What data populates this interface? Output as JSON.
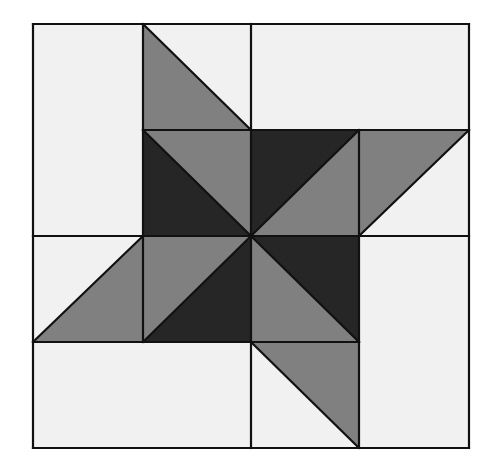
{
  "diagram": {
    "colors": {
      "light": "#f1f1f1",
      "medium": "#808080",
      "dark": "#262626",
      "stroke": "#111111",
      "background": "#ffffff"
    },
    "grid": {
      "xs": [
        33,
        143,
        251,
        359,
        469
      ],
      "ys": [
        24,
        130,
        236,
        342,
        448
      ]
    },
    "shapes": [
      {
        "name": "light-rect-left-top",
        "fill": "light",
        "points": [
          [
            33,
            24
          ],
          [
            143,
            24
          ],
          [
            143,
            236
          ],
          [
            33,
            236
          ]
        ]
      },
      {
        "name": "light-rect-top-right",
        "fill": "light",
        "points": [
          [
            251,
            24
          ],
          [
            469,
            24
          ],
          [
            469,
            130
          ],
          [
            251,
            130
          ]
        ]
      },
      {
        "name": "light-tri-top-mid",
        "fill": "light",
        "points": [
          [
            143,
            24
          ],
          [
            251,
            24
          ],
          [
            251,
            130
          ]
        ]
      },
      {
        "name": "medium-tri-top-mid",
        "fill": "medium",
        "points": [
          [
            143,
            24
          ],
          [
            251,
            130
          ],
          [
            143,
            130
          ]
        ]
      },
      {
        "name": "light-rect-top-col2",
        "fill": "light",
        "points": [
          [
            251,
            24
          ],
          [
            251,
            130
          ]
        ]
      },
      {
        "name": "dark-tri-r1c1",
        "fill": "dark",
        "points": [
          [
            143,
            130
          ],
          [
            251,
            236
          ],
          [
            143,
            236
          ]
        ]
      },
      {
        "name": "medium-tri-r1c1",
        "fill": "medium",
        "points": [
          [
            143,
            130
          ],
          [
            251,
            130
          ],
          [
            251,
            236
          ]
        ]
      },
      {
        "name": "dark-tri-r1c2",
        "fill": "dark",
        "points": [
          [
            251,
            130
          ],
          [
            359,
            130
          ],
          [
            251,
            236
          ]
        ]
      },
      {
        "name": "medium-tri-r1c2",
        "fill": "medium",
        "points": [
          [
            359,
            130
          ],
          [
            359,
            236
          ],
          [
            251,
            236
          ]
        ]
      },
      {
        "name": "medium-tri-r1c3",
        "fill": "medium",
        "points": [
          [
            359,
            130
          ],
          [
            469,
            130
          ],
          [
            359,
            236
          ]
        ]
      },
      {
        "name": "light-tri-r1c3",
        "fill": "light",
        "points": [
          [
            469,
            130
          ],
          [
            469,
            236
          ],
          [
            359,
            236
          ]
        ]
      },
      {
        "name": "light-tri-r2c0",
        "fill": "light",
        "points": [
          [
            33,
            236
          ],
          [
            143,
            236
          ],
          [
            33,
            342
          ]
        ]
      },
      {
        "name": "medium-tri-r2c0",
        "fill": "medium",
        "points": [
          [
            143,
            236
          ],
          [
            143,
            342
          ],
          [
            33,
            342
          ]
        ]
      },
      {
        "name": "medium-tri-r2c1",
        "fill": "medium",
        "points": [
          [
            143,
            236
          ],
          [
            251,
            236
          ],
          [
            143,
            342
          ]
        ]
      },
      {
        "name": "dark-tri-r2c1",
        "fill": "dark",
        "points": [
          [
            251,
            236
          ],
          [
            251,
            342
          ],
          [
            143,
            342
          ]
        ]
      },
      {
        "name": "dark-tri-r2c2",
        "fill": "dark",
        "points": [
          [
            251,
            236
          ],
          [
            359,
            236
          ],
          [
            359,
            342
          ]
        ]
      },
      {
        "name": "medium-tri-r2c2",
        "fill": "medium",
        "points": [
          [
            251,
            236
          ],
          [
            359,
            342
          ],
          [
            251,
            342
          ]
        ]
      },
      {
        "name": "light-rect-right-bottom",
        "fill": "light",
        "points": [
          [
            359,
            236
          ],
          [
            469,
            236
          ],
          [
            469,
            448
          ],
          [
            359,
            448
          ]
        ]
      },
      {
        "name": "light-rect-bottom-left",
        "fill": "light",
        "points": [
          [
            33,
            342
          ],
          [
            251,
            342
          ],
          [
            251,
            448
          ],
          [
            33,
            448
          ]
        ]
      },
      {
        "name": "medium-tri-r3c2",
        "fill": "medium",
        "points": [
          [
            251,
            342
          ],
          [
            359,
            342
          ],
          [
            359,
            448
          ]
        ]
      },
      {
        "name": "light-tri-r3c2",
        "fill": "light",
        "points": [
          [
            251,
            342
          ],
          [
            359,
            448
          ],
          [
            251,
            448
          ]
        ]
      }
    ],
    "lines": [
      [
        [
          33,
          24
        ],
        [
          469,
          24
        ]
      ],
      [
        [
          33,
          448
        ],
        [
          469,
          448
        ]
      ],
      [
        [
          33,
          24
        ],
        [
          33,
          448
        ]
      ],
      [
        [
          469,
          24
        ],
        [
          469,
          448
        ]
      ],
      [
        [
          143,
          24
        ],
        [
          143,
          342
        ]
      ],
      [
        [
          251,
          24
        ],
        [
          251,
          130
        ]
      ],
      [
        [
          251,
          130
        ],
        [
          251,
          342
        ]
      ],
      [
        [
          251,
          342
        ],
        [
          251,
          448
        ]
      ],
      [
        [
          359,
          130
        ],
        [
          359,
          448
        ]
      ],
      [
        [
          143,
          130
        ],
        [
          469,
          130
        ]
      ],
      [
        [
          33,
          236
        ],
        [
          469,
          236
        ]
      ],
      [
        [
          33,
          342
        ],
        [
          359,
          342
        ]
      ],
      [
        [
          143,
          24
        ],
        [
          251,
          130
        ]
      ],
      [
        [
          143,
          130
        ],
        [
          251,
          236
        ]
      ],
      [
        [
          251,
          236
        ],
        [
          359,
          130
        ]
      ],
      [
        [
          359,
          236
        ],
        [
          469,
          130
        ]
      ],
      [
        [
          251,
          236
        ],
        [
          359,
          342
        ]
      ],
      [
        [
          251,
          342
        ],
        [
          359,
          448
        ]
      ],
      [
        [
          143,
          342
        ],
        [
          251,
          236
        ]
      ],
      [
        [
          33,
          342
        ],
        [
          143,
          236
        ]
      ]
    ]
  }
}
